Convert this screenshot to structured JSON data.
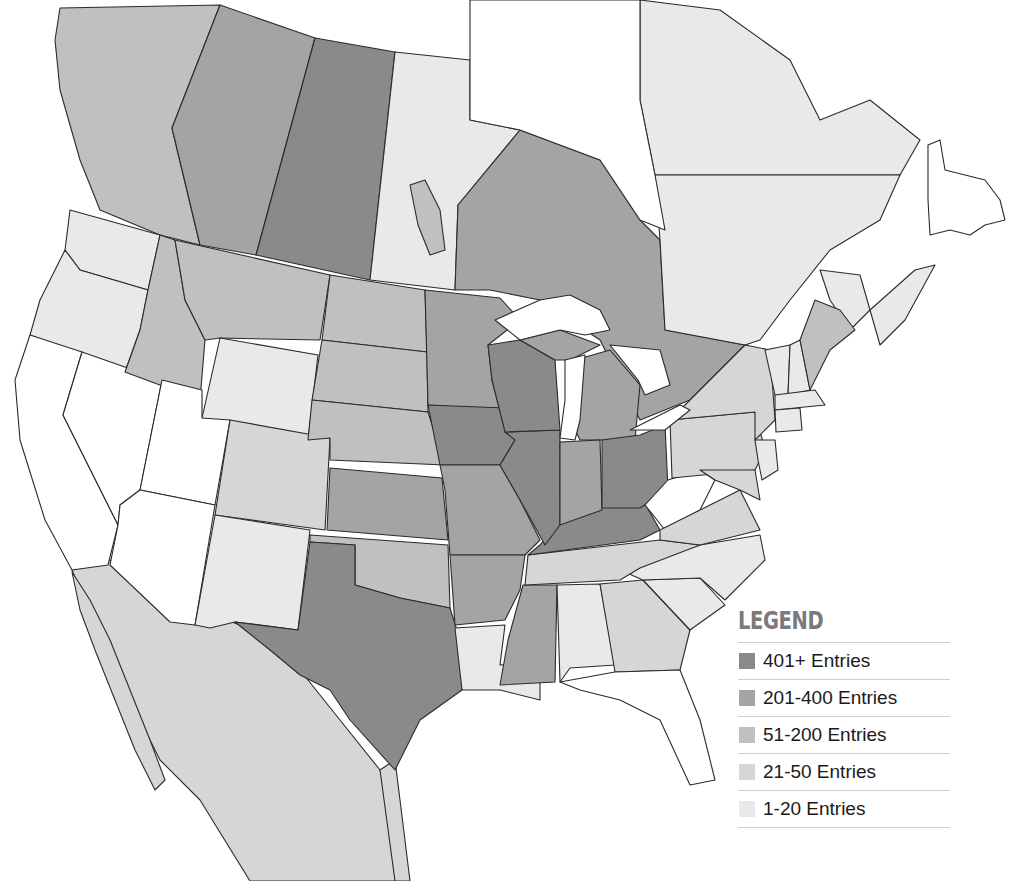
{
  "legend": {
    "title": "LEGEND",
    "items": [
      {
        "label": "401+ Entries",
        "color": "#8a8a8a",
        "class": "c401"
      },
      {
        "label": "201-400 Entries",
        "color": "#a4a4a4",
        "class": "c201"
      },
      {
        "label": "51-200 Entries",
        "color": "#c0c0c0",
        "class": "c51"
      },
      {
        "label": "21-50 Entries",
        "color": "#d6d6d6",
        "class": "c21"
      },
      {
        "label": "1-20 Entries",
        "color": "#e9e9e9",
        "class": "c1"
      }
    ]
  },
  "regions": {
    "401+": [
      "Saskatchewan",
      "Wisconsin",
      "Iowa",
      "Illinois",
      "Ohio",
      "Kentucky",
      "Texas"
    ],
    "201-400": [
      "Alberta",
      "Ontario",
      "Minnesota",
      "Kansas",
      "Missouri",
      "Indiana",
      "Arkansas",
      "Mississippi",
      "Michigan"
    ],
    "51-200": [
      "British Columbia",
      "Idaho",
      "Montana",
      "North Dakota",
      "South Dakota",
      "Nebraska",
      "Oklahoma",
      "Maine",
      "Georgia"
    ],
    "21-50": [
      "Colorado",
      "Tennessee",
      "Virginia",
      "Pennsylvania",
      "New York",
      "Maryland",
      "Mexico"
    ],
    "1-20": [
      "Washington",
      "Oregon",
      "Wyoming",
      "New Mexico",
      "Manitoba",
      "Quebec",
      "Louisiana",
      "Alabama",
      "North Carolina",
      "South Carolina",
      "New Brunswick",
      "Nova Scotia",
      "New England",
      "New Jersey"
    ],
    "none": [
      "California",
      "Nevada",
      "Utah",
      "Arizona",
      "West Virginia",
      "Florida",
      "Newfoundland"
    ]
  }
}
